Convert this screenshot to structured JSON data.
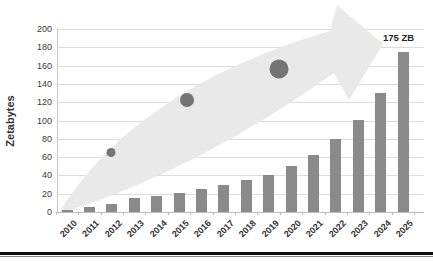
{
  "chart_data": {
    "type": "bar",
    "title": "",
    "categories": [
      "2010",
      "2011",
      "2012",
      "2013",
      "2014",
      "2015",
      "2016",
      "2017",
      "2018",
      "2019",
      "2020",
      "2021",
      "2022",
      "2023",
      "2024",
      "2025"
    ],
    "values": [
      2,
      5,
      9,
      15,
      18,
      21,
      25,
      29,
      35,
      40,
      50,
      62,
      80,
      101,
      130,
      175
    ],
    "xlabel": "",
    "ylabel": "Zetabytes",
    "ylim": [
      0,
      200
    ],
    "ytick_step": 20,
    "grid": "horizontal",
    "legend": "none",
    "annotations": [
      {
        "text": "175 ZB",
        "target": "2025"
      }
    ],
    "decorations": [
      "upward-growth-block-arrow",
      "three-trend-dots-small-medium-large"
    ]
  },
  "colors": {
    "bar": "#8a8a8a",
    "dot": "#747474",
    "arrow": "#e9e9e9",
    "gridline": "#dcdcdc",
    "axis_text": "#3a3a3a",
    "annotation_text": "#262626",
    "bottom_rule": "#111111"
  }
}
